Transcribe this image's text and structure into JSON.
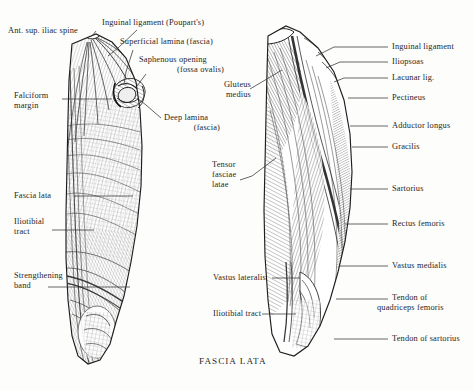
{
  "plate": {
    "caption": "FASCIA LATA",
    "background_color": "#fdfdfc",
    "ink_color": "#262626",
    "width": 473,
    "height": 391
  },
  "figures": [
    {
      "name": "left-figure-fascia-lata-superficial",
      "description": "Anterior view of right thigh with fascia lata intact, showing saphenous opening"
    },
    {
      "name": "right-figure-fascia-lata-removed",
      "description": "Anterior view of right thigh with fascia lata removed, showing underlying muscles"
    }
  ],
  "left_labels": [
    {
      "id": "ant-sup-iliac-spine",
      "lines": [
        "Ant. sup. iliac spine"
      ],
      "x": 8,
      "y": 26,
      "align": "left"
    },
    {
      "id": "inguinal-ligament-poupart",
      "lines": [
        "Inguinal ligament (Poupart's)"
      ],
      "x": 102,
      "y": 18,
      "align": "left"
    },
    {
      "id": "superficial-lamina-fascia",
      "lines": [
        "Superficial lamina (fascia)"
      ],
      "x": 120,
      "y": 38,
      "align": "left"
    },
    {
      "id": "saphenous-opening",
      "lines": [
        "Saphenous opening",
        "(fossa ovalis)"
      ],
      "x": 139,
      "y": 56,
      "align": "left"
    },
    {
      "id": "falciform-margin",
      "lines": [
        "Falciform",
        "margin"
      ],
      "x": 14,
      "y": 91,
      "align": "left"
    },
    {
      "id": "deep-lamina-fascia",
      "lines": [
        "Deep lamina",
        "(fascia)",
        "__ralign"
      ],
      "x": 164,
      "y": 115,
      "align": "left"
    },
    {
      "id": "fascia-lata",
      "lines": [
        "Fascia lata"
      ],
      "x": 14,
      "y": 191,
      "align": "left"
    },
    {
      "id": "iliotibial-tract-left",
      "lines": [
        "Iliotibial",
        "tract"
      ],
      "x": 14,
      "y": 218,
      "align": "left"
    },
    {
      "id": "strengthening-band",
      "lines": [
        "Strengthening",
        "band"
      ],
      "x": 14,
      "y": 271,
      "align": "left"
    }
  ],
  "middle_labels": [
    {
      "id": "gluteus-medius",
      "lines": [
        "Gluteus",
        "medius"
      ],
      "x": 211,
      "y": 81,
      "align": "left"
    },
    {
      "id": "tensor-fasciae-latae",
      "lines": [
        "Tensor",
        "fasciae",
        "latae"
      ],
      "x": 212,
      "y": 163,
      "align": "left"
    },
    {
      "id": "vastus-lateralis",
      "lines": [
        "Vastus lateralis"
      ],
      "x": 213,
      "y": 274,
      "align": "left"
    },
    {
      "id": "iliotibial-tract-middle",
      "lines": [
        "Iliotibial tract"
      ],
      "x": 213,
      "y": 310,
      "align": "left"
    }
  ],
  "right_labels": [
    {
      "id": "inguinal-ligament-right",
      "lines": [
        "Inguinal ligament"
      ],
      "x": 392,
      "y": 43,
      "align": "left"
    },
    {
      "id": "iliopsoas",
      "lines": [
        "Iliopsoas"
      ],
      "x": 392,
      "y": 59,
      "align": "left"
    },
    {
      "id": "lacunar-lig",
      "lines": [
        "Lacunar lig."
      ],
      "x": 392,
      "y": 75,
      "align": "left"
    },
    {
      "id": "pectineus",
      "lines": [
        "Pectineus"
      ],
      "x": 392,
      "y": 95,
      "align": "left"
    },
    {
      "id": "adductor-longus",
      "lines": [
        "Adductor longus"
      ],
      "x": 392,
      "y": 122,
      "align": "left"
    },
    {
      "id": "gracilis",
      "lines": [
        "Gracilis"
      ],
      "x": 392,
      "y": 143,
      "align": "left"
    },
    {
      "id": "sartorius",
      "lines": [
        "Sartorius"
      ],
      "x": 392,
      "y": 185,
      "align": "left"
    },
    {
      "id": "rectus-femoris",
      "lines": [
        "Rectus femoris"
      ],
      "x": 392,
      "y": 221,
      "align": "left"
    },
    {
      "id": "vastus-medialis",
      "lines": [
        "Vastus medialis"
      ],
      "x": 392,
      "y": 262,
      "align": "left"
    },
    {
      "id": "tendon-of-quadriceps-femoris",
      "lines": [
        "Tendon of",
        "quadriceps femoris"
      ],
      "x": 392,
      "y": 295,
      "align": "left"
    },
    {
      "id": "tendon-of-sartorius",
      "lines": [
        "Tendon of sartorius"
      ],
      "x": 392,
      "y": 335,
      "align": "left"
    }
  ],
  "caption_pos": {
    "x": 199,
    "y": 356
  }
}
